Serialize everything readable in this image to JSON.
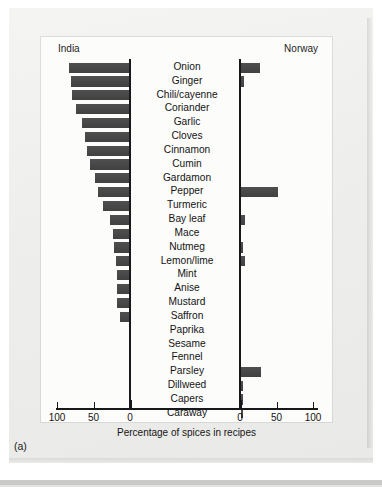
{
  "figure": {
    "caption": "(a)",
    "left_panel_title": "India",
    "right_panel_title": "Norway",
    "axis_title": "Percentage of spices in recipes",
    "bar_color": "#464646",
    "axis_color": "#16181a",
    "background_color": "#f0f0ee",
    "panel_background": "#fcfcfb"
  },
  "axes": {
    "left_ticks": [
      "100",
      "50",
      "0"
    ],
    "right_ticks": [
      "0",
      "50",
      "100"
    ],
    "tick_values": [
      100,
      50,
      0,
      0,
      50,
      100
    ],
    "range_max": 100
  },
  "chart_data": {
    "type": "bar",
    "title": "Percentage of spices in recipes",
    "subtitle": "",
    "orientation": "horizontal",
    "layout": "butterfly/diverging dual-panel (back-to-back bars)",
    "xlabel": "Percentage of spices in recipes",
    "ylabel": "",
    "xlim": [
      0,
      100
    ],
    "grid": false,
    "legend_position": "panel headers (India left, Norway right)",
    "categories": [
      "Onion",
      "Ginger",
      "Chili/cayenne",
      "Coriander",
      "Garlic",
      "Cloves",
      "Cinnamon",
      "Cumin",
      "Gardamon",
      "Pepper",
      "Turmeric",
      "Bay leaf",
      "Mace",
      "Nutmeg",
      "Lemon/lime",
      "Mint",
      "Anise",
      "Mustard",
      "Saffron",
      "Paprika",
      "Sesame",
      "Fennel",
      "Parsley",
      "Dillweed",
      "Capers",
      "Caraway"
    ],
    "series": [
      {
        "name": "India",
        "side": "left",
        "values": [
          82,
          80,
          78,
          72,
          65,
          60,
          57,
          54,
          47,
          42,
          36,
          26,
          22,
          21,
          18,
          17,
          17,
          16,
          13,
          0,
          0,
          0,
          0,
          0,
          0,
          0
        ]
      },
      {
        "name": "Norway",
        "side": "right",
        "values": [
          26,
          4,
          0,
          0,
          0,
          0,
          0,
          0,
          0,
          50,
          0,
          5,
          0,
          1,
          6,
          0,
          0,
          0,
          0,
          0,
          0,
          0,
          28,
          3,
          2,
          3
        ]
      }
    ]
  }
}
